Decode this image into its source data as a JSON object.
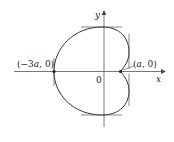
{
  "figure": {
    "type": "limacon-curve",
    "axes": {
      "x_label": "x",
      "y_label": "y",
      "origin_label": "0"
    },
    "points": [
      {
        "label": "(−3a, 0)",
        "label_pre": "(−3",
        "label_var": "a",
        "label_post": ", 0)"
      },
      {
        "label": "(a, 0)",
        "label_pre": "(",
        "label_var": "a",
        "label_post": ", 0)"
      }
    ],
    "tangent_lines": [
      "top-horizontal",
      "bottom-horizontal",
      "left-vertical",
      "right-vertical-upper",
      "right-vertical-lower"
    ],
    "colors": {
      "curve": "#333333",
      "axes": "#555555",
      "text": "#222222"
    }
  }
}
